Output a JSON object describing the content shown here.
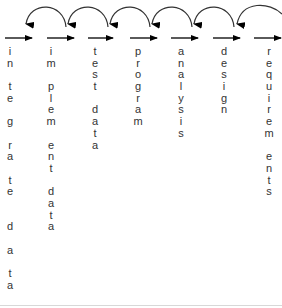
{
  "diagram": {
    "type": "process-flow with feedback arrows",
    "stroke_color": "#000000",
    "arc_color": "#333333",
    "text_color": "#333333",
    "stages": [
      {
        "label": "integrate data",
        "lines": [
          "i",
          "n",
          "",
          "t",
          "e",
          "",
          "g",
          "",
          "r",
          "a",
          "",
          "t",
          "e",
          "",
          "",
          "d",
          "",
          "a",
          "",
          "t",
          "a"
        ],
        "x": 10
      },
      {
        "label": "implement data",
        "lines": [
          "i",
          "m",
          "",
          "p",
          "l",
          "e",
          "m",
          "",
          "e",
          "n",
          "t",
          "",
          "d",
          "a",
          "t",
          "a"
        ],
        "x": 50
      },
      {
        "label": "test data",
        "lines": [
          "t",
          "e",
          "s",
          "t",
          "",
          "d",
          "a",
          "t",
          "a"
        ],
        "x": 95
      },
      {
        "label": "program",
        "lines": [
          "p",
          "r",
          "o",
          "g",
          "r",
          "a",
          "m"
        ],
        "x": 133
      },
      {
        "label": "analysis",
        "lines": [
          "a",
          "n",
          "a",
          "l",
          "y",
          "s",
          "i",
          "s"
        ],
        "x": 182
      },
      {
        "label": "design",
        "lines": [
          "d",
          "e",
          "s",
          "i",
          "g",
          "n"
        ],
        "x": 224
      },
      {
        "label": "requirements",
        "lines": [
          "r",
          "e",
          "q",
          "u",
          "i",
          "r",
          "e",
          "m",
          "",
          "e",
          "n",
          "t",
          "s"
        ],
        "x": 270
      }
    ]
  }
}
